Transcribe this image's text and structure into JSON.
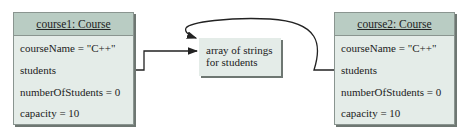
{
  "objects": [
    {
      "title": "course1: Course",
      "fields": [
        "courseName = \"C++\"",
        "students",
        "numberOfStudents = 0",
        "capacity = 10"
      ]
    },
    {
      "title": "course2: Course",
      "fields": [
        "courseName = \"C++\"",
        "students",
        "numberOfStudents = 0",
        "capacity = 10"
      ]
    }
  ],
  "array_box": {
    "line1": "array of strings",
    "line2": "for students"
  },
  "colors": {
    "header_fill": "#b9ccc3",
    "body_fill": "#e4ece8",
    "shadow": "#6e7772"
  }
}
